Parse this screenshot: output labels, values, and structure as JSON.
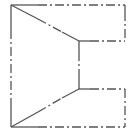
{
  "diagram": {
    "type": "technical-line-drawing",
    "stroke_color": "#555555",
    "background": "#ffffff",
    "points": {
      "top_left": [
        11,
        5
      ],
      "top_right": [
        125,
        5
      ],
      "upper_inner_right": [
        125,
        41
      ],
      "upper_notch": [
        79,
        41
      ],
      "lower_notch": [
        79,
        89
      ],
      "lower_inner_right": [
        125,
        89
      ],
      "bottom_right": [
        125,
        127
      ],
      "bottom_left": [
        11,
        127
      ]
    },
    "segments": [
      {
        "name": "top-edge-solid",
        "from": "top_left",
        "to": [
          50,
          5
        ],
        "style": "solid"
      },
      {
        "name": "top-edge-dashdot",
        "from": [
          50,
          5
        ],
        "to": "top_right",
        "style": "dash-dot"
      },
      {
        "name": "right-upper-edge",
        "from": "top_right",
        "to": "upper_inner_right",
        "style": "dash-dot"
      },
      {
        "name": "upper-inner-edge",
        "from": "upper_inner_right",
        "to": "upper_notch",
        "style": "dash-dot"
      },
      {
        "name": "upper-diagonal",
        "from": "top_left",
        "to": "upper_notch",
        "style": "dash-dot"
      },
      {
        "name": "notch-vertical",
        "from": "upper_notch",
        "to": "lower_notch",
        "style": "dash-dot"
      },
      {
        "name": "lower-diagonal",
        "from": "bottom_left",
        "to": "lower_notch",
        "style": "dash-dot"
      },
      {
        "name": "lower-inner-edge",
        "from": "lower_notch",
        "to": "lower_inner_right",
        "style": "dash-dot"
      },
      {
        "name": "right-lower-edge",
        "from": "lower_inner_right",
        "to": "bottom_right",
        "style": "dash-dot"
      },
      {
        "name": "bottom-edge",
        "from": "bottom_left",
        "to": "bottom_right",
        "style": "dash-dot"
      },
      {
        "name": "left-edge",
        "from": "top_left",
        "to": "bottom_left",
        "style": "dash-dot"
      }
    ]
  }
}
